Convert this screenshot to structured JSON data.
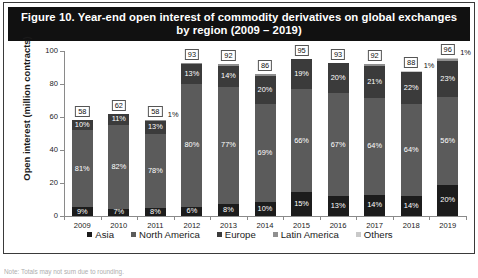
{
  "figure": {
    "title": "Figure 10.  Year-end open interest of commodity derivatives on global exchanges by region (2009 – 2019)",
    "title_line1": "Figure 10.  Year-end open interest of commodity derivatives on global exchanges",
    "title_line2": "by region (2009 – 2019)",
    "footnote": "Note: Totals may not sum due to rounding."
  },
  "colors": {
    "asia": "#1c1c1c",
    "north_america": "#5b5b5b",
    "europe": "#3b3b3b",
    "latin_america": "#8f8f8f",
    "others": "#c9c9c9",
    "title_bar": "#111111",
    "axis": "#8a8a8a"
  },
  "chart_data": {
    "type": "bar",
    "stacked": true,
    "title": "Figure 10.  Year-end open interest of commodity derivatives on global exchanges by region (2009 – 2019)",
    "xlabel": "",
    "ylabel": "Open interest (million contracts)",
    "ylim": [
      0,
      100
    ],
    "yticks": [
      0,
      20,
      40,
      60,
      80,
      100
    ],
    "ytick_labels": [
      "0",
      "20",
      "40",
      "60",
      "80",
      "100"
    ],
    "grid": false,
    "legend_position": "bottom",
    "categories": [
      "2009",
      "2010",
      "2011",
      "2012",
      "2013",
      "2014",
      "2015",
      "2016",
      "2017",
      "2018",
      "2019"
    ],
    "totals": [
      58,
      62,
      58,
      93,
      92,
      86,
      95,
      93,
      92,
      88,
      96
    ],
    "total_labels": [
      "58",
      "62",
      "58",
      "93",
      "92",
      "86",
      "95",
      "93",
      "92",
      "88",
      "96"
    ],
    "series": [
      {
        "name": "Asia",
        "color": "#1c1c1c",
        "values": [
          9,
          7,
          8,
          6,
          8,
          10,
          15,
          13,
          14,
          14,
          20
        ],
        "labels": [
          "9%",
          "7%",
          "8%",
          "6%",
          "8%",
          "10%",
          "15%",
          "13%",
          "14%",
          "14%",
          "20%"
        ]
      },
      {
        "name": "North America",
        "color": "#5b5b5b",
        "values": [
          81,
          82,
          78,
          80,
          77,
          69,
          66,
          67,
          64,
          64,
          56
        ],
        "labels": [
          "81%",
          "82%",
          "78%",
          "80%",
          "77%",
          "69%",
          "66%",
          "67%",
          "64%",
          "64%",
          "56%"
        ]
      },
      {
        "name": "Europe",
        "color": "#3b3b3b",
        "values": [
          10,
          11,
          13,
          13,
          14,
          20,
          19,
          20,
          21,
          22,
          23
        ],
        "labels": [
          "10%",
          "11%",
          "13%",
          "13%",
          "14%",
          "20%",
          "19%",
          "20%",
          "21%",
          "22%",
          "23%"
        ]
      },
      {
        "name": "Latin America",
        "color": "#8f8f8f",
        "values": [
          0,
          0,
          1,
          1,
          1,
          1,
          0,
          0,
          1,
          0,
          1
        ],
        "labels": [
          "",
          "",
          "1%",
          "",
          "",
          "",
          "",
          "",
          "",
          "",
          ""
        ]
      },
      {
        "name": "Others",
        "color": "#c9c9c9",
        "values": [
          0,
          0,
          0,
          0,
          0,
          0,
          0,
          0,
          0,
          1,
          1
        ],
        "labels": [
          "",
          "",
          "",
          "",
          "",
          "",
          "",
          "",
          "",
          "1%",
          "1%"
        ]
      }
    ],
    "outside_labels": [
      {
        "category": "2011",
        "text": "1%"
      },
      {
        "category": "2018",
        "text": "1%"
      },
      {
        "category": "2019",
        "text": "1%"
      }
    ]
  },
  "legend": {
    "items": [
      {
        "label": "Asia",
        "color": "#1c1c1c"
      },
      {
        "label": "North America",
        "color": "#5b5b5b"
      },
      {
        "label": "Europe",
        "color": "#3b3b3b"
      },
      {
        "label": "Latin America",
        "color": "#8f8f8f"
      },
      {
        "label": "Others",
        "color": "#c9c9c9"
      }
    ]
  }
}
